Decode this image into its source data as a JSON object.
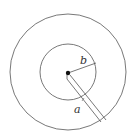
{
  "diagram": {
    "title": "",
    "labels": {
      "inner_radius": "b",
      "outer_radius": "a"
    },
    "colors": {
      "stroke": "#555555",
      "background": "#ffffff",
      "dot": "#111111"
    },
    "shapes": {
      "outer_circle": {
        "cx": 68,
        "cy": 72,
        "r": 58
      },
      "inner_circle": {
        "cx": 68,
        "cy": 72,
        "r": 28
      },
      "center_dot": {
        "cx": 68,
        "cy": 73,
        "r": 2.2
      }
    }
  }
}
